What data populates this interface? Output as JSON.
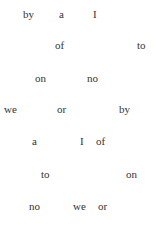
{
  "words": [
    {
      "text": "by",
      "x": 23,
      "y": 9
    },
    {
      "text": "a",
      "x": 59,
      "y": 9
    },
    {
      "text": "I",
      "x": 93,
      "y": 9
    },
    {
      "text": "of",
      "x": 55,
      "y": 40
    },
    {
      "text": "to",
      "x": 137,
      "y": 40
    },
    {
      "text": "on",
      "x": 35,
      "y": 73
    },
    {
      "text": "no",
      "x": 87,
      "y": 73
    },
    {
      "text": "we",
      "x": 4,
      "y": 104
    },
    {
      "text": "or",
      "x": 57,
      "y": 104
    },
    {
      "text": "by",
      "x": 119,
      "y": 104
    },
    {
      "text": "a",
      "x": 32,
      "y": 136
    },
    {
      "text": "I",
      "x": 80,
      "y": 136
    },
    {
      "text": "of",
      "x": 96,
      "y": 136
    },
    {
      "text": "to",
      "x": 41,
      "y": 169
    },
    {
      "text": "on",
      "x": 126,
      "y": 169
    },
    {
      "text": "no",
      "x": 29,
      "y": 201
    },
    {
      "text": "we",
      "x": 73,
      "y": 201
    },
    {
      "text": "or",
      "x": 98,
      "y": 201
    }
  ]
}
